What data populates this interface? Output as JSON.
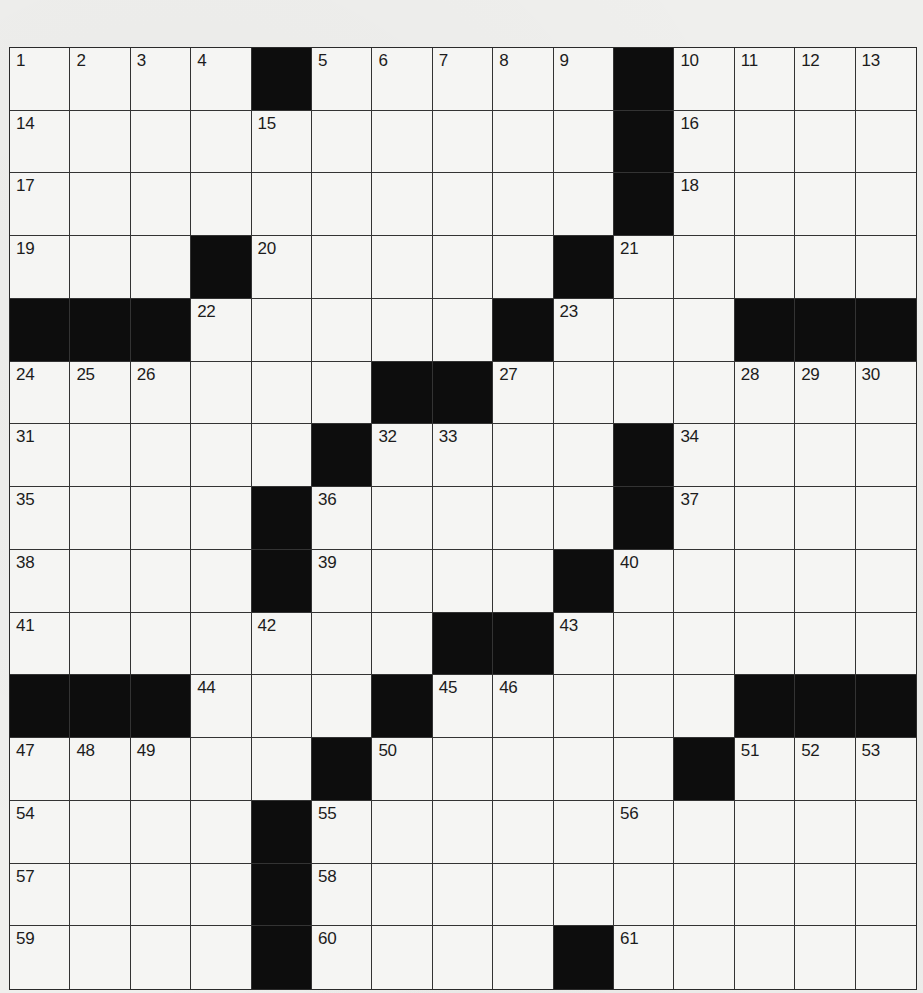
{
  "puzzle": {
    "rows": 15,
    "cols": 15,
    "colors": {
      "block": "#0d0d0d",
      "cell": "#f5f5f3",
      "line": "#333333",
      "paper": "#efefed"
    },
    "grid": [
      [
        "1",
        "2",
        "3",
        "4",
        "#",
        "5",
        "6",
        "7",
        "8",
        "9",
        "#",
        "10",
        "11",
        "12",
        "13"
      ],
      [
        "14",
        "",
        "",
        "",
        "15",
        "",
        "",
        "",
        "",
        "",
        "#",
        "16",
        "",
        "",
        ""
      ],
      [
        "17",
        "",
        "",
        "",
        "",
        "",
        "",
        "",
        "",
        "",
        "#",
        "18",
        "",
        "",
        ""
      ],
      [
        "19",
        "",
        "",
        "#",
        "20",
        "",
        "",
        "",
        "",
        "#",
        "21",
        "",
        "",
        "",
        ""
      ],
      [
        "#",
        "#",
        "#",
        "22",
        "",
        "",
        "",
        "",
        "#",
        "23",
        "",
        "",
        "#",
        "#",
        "#"
      ],
      [
        "24",
        "25",
        "26",
        "",
        "",
        "",
        "#",
        "#",
        "27",
        "",
        "",
        "",
        "28",
        "29",
        "30"
      ],
      [
        "31",
        "",
        "",
        "",
        "",
        "#",
        "32",
        "33",
        "",
        "",
        "#",
        "34",
        "",
        "",
        ""
      ],
      [
        "35",
        "",
        "",
        "",
        "#",
        "36",
        "",
        "",
        "",
        "",
        "#",
        "37",
        "",
        "",
        ""
      ],
      [
        "38",
        "",
        "",
        "",
        "#",
        "39",
        "",
        "",
        "",
        "#",
        "40",
        "",
        "",
        "",
        ""
      ],
      [
        "41",
        "",
        "",
        "",
        "42",
        "",
        "",
        "#",
        "#",
        "43",
        "",
        "",
        "",
        "",
        ""
      ],
      [
        "#",
        "#",
        "#",
        "44",
        "",
        "",
        "#",
        "45",
        "46",
        "",
        "",
        "",
        "#",
        "#",
        "#"
      ],
      [
        "47",
        "48",
        "49",
        "",
        "",
        "#",
        "50",
        "",
        "",
        "",
        "",
        "#",
        "51",
        "52",
        "53"
      ],
      [
        "54",
        "",
        "",
        "",
        "#",
        "55",
        "",
        "",
        "",
        "",
        "56",
        "",
        "",
        "",
        ""
      ],
      [
        "57",
        "",
        "",
        "",
        "#",
        "58",
        "",
        "",
        "",
        "",
        "",
        "",
        "",
        "",
        ""
      ],
      [
        "59",
        "",
        "",
        "",
        "#",
        "60",
        "",
        "",
        "",
        "#",
        "61",
        "",
        "",
        "",
        ""
      ]
    ],
    "letters": []
  }
}
